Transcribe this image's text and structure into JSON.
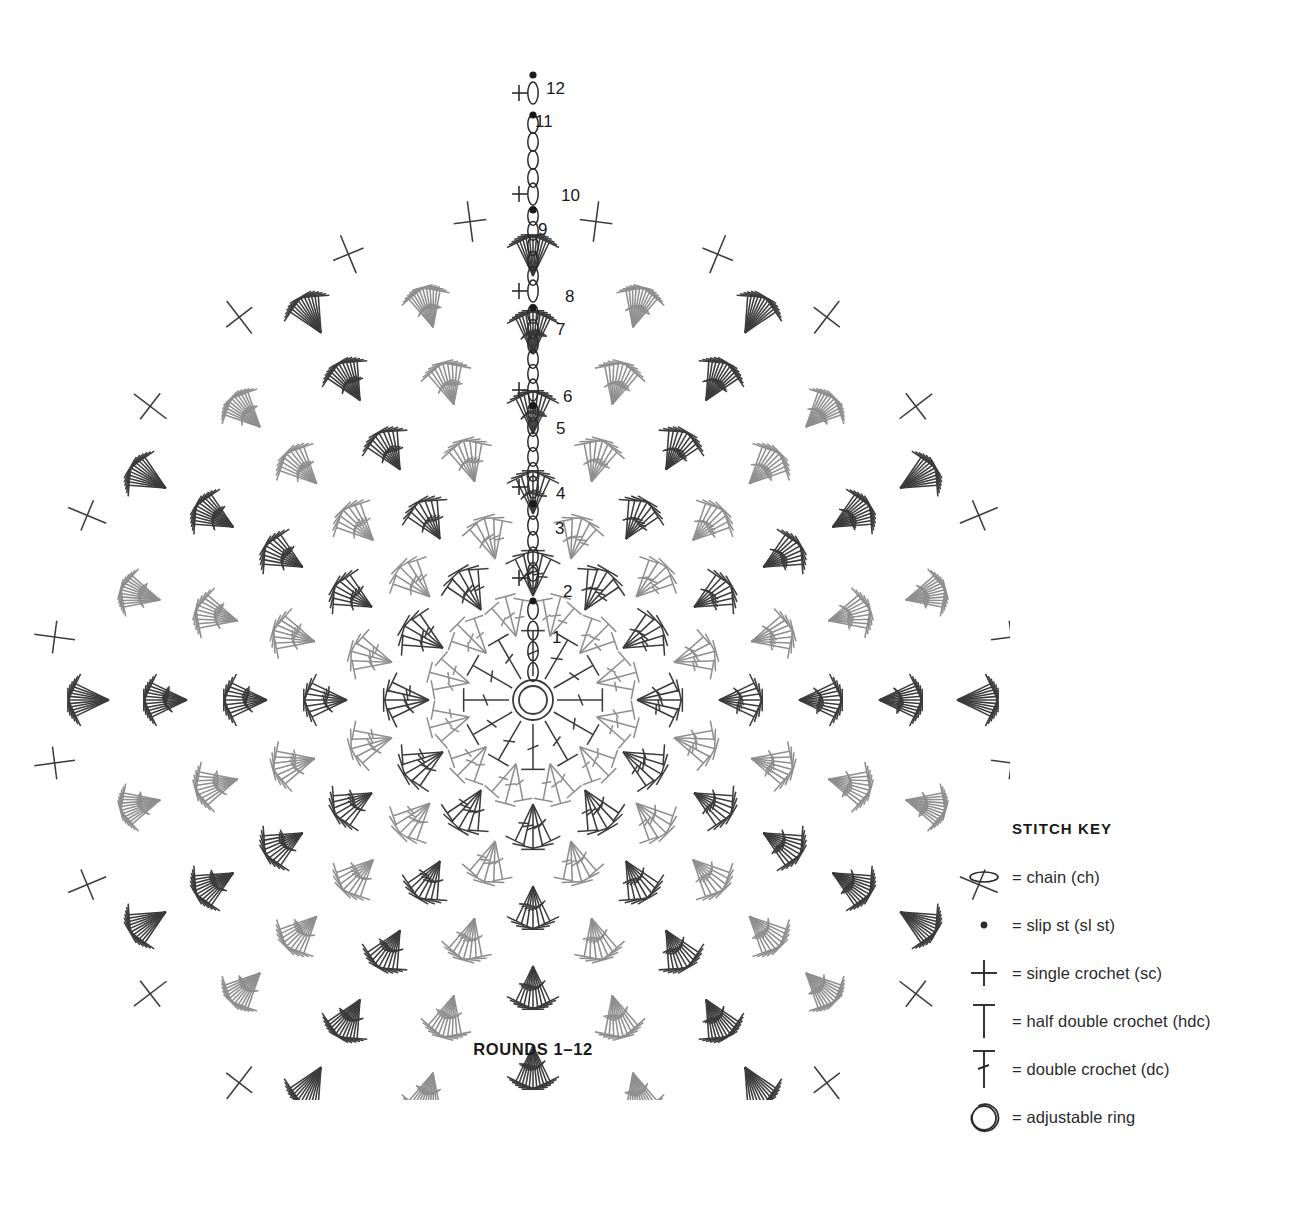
{
  "caption": "ROUNDS 1–12",
  "stitch_key": {
    "title": "STITCH KEY",
    "items": [
      {
        "icon": "chain-icon",
        "label": "= chain (ch)"
      },
      {
        "icon": "slip-stitch-icon",
        "label": "= slip st (sl st)"
      },
      {
        "icon": "single-crochet-icon",
        "label": "= single crochet (sc)"
      },
      {
        "icon": "half-double-crochet-icon",
        "label": "= half double crochet (hdc)"
      },
      {
        "icon": "double-crochet-icon",
        "label": "= double crochet (dc)"
      },
      {
        "icon": "adjustable-ring-icon",
        "label": "= adjustable ring"
      }
    ]
  },
  "colors": {
    "dark": "#3c3c3c",
    "light": "#8f8f8f",
    "text": "#1a1a1a",
    "background": "#ffffff"
  },
  "chart_data": {
    "type": "diagram",
    "title": "ROUNDS 1–12",
    "center": {
      "x": 533,
      "y": 700
    },
    "ring": {
      "label": "adjustable ring",
      "outer_radius": 20,
      "inner_radius": 14
    },
    "round_labels": [
      "1",
      "2",
      "3",
      "4",
      "5",
      "6",
      "7",
      "8",
      "9",
      "10",
      "11",
      "12"
    ],
    "round_label_positions": [
      {
        "round": "1",
        "x": 552,
        "y": 643
      },
      {
        "round": "2",
        "x": 563,
        "y": 597
      },
      {
        "round": "3",
        "x": 555,
        "y": 534
      },
      {
        "round": "4",
        "x": 556,
        "y": 499
      },
      {
        "round": "5",
        "x": 556,
        "y": 434
      },
      {
        "round": "6",
        "x": 563,
        "y": 402
      },
      {
        "round": "7",
        "x": 556,
        "y": 335
      },
      {
        "round": "8",
        "x": 565,
        "y": 302
      },
      {
        "round": "9",
        "x": 538,
        "y": 235
      },
      {
        "round": "10",
        "x": 561,
        "y": 201
      },
      {
        "round": "11",
        "x": 535,
        "y": 127
      },
      {
        "round": "12",
        "x": 546,
        "y": 94
      }
    ],
    "rounds": [
      {
        "round": 1,
        "radius": 66,
        "clusters": 12,
        "stitch": "dc",
        "tone": "dark",
        "per_cluster": 1
      },
      {
        "round": 2,
        "radius": 104,
        "clusters": 12,
        "stitch": "dc",
        "tone": "light",
        "per_cluster": 3
      },
      {
        "round": 3,
        "radius": 146,
        "clusters": 12,
        "stitch": "dc",
        "tone": "dark",
        "per_cluster": 5
      },
      {
        "round": 4,
        "radius": 186,
        "clusters": 12,
        "stitch": "dc",
        "tone": "light",
        "per_cluster": 5
      },
      {
        "round": 5,
        "radius": 226,
        "clusters": 12,
        "stitch": "dc",
        "tone": "dark",
        "per_cluster": 7
      },
      {
        "round": 6,
        "radius": 266,
        "clusters": 12,
        "stitch": "dc",
        "tone": "light",
        "per_cluster": 7
      },
      {
        "round": 7,
        "radius": 306,
        "clusters": 12,
        "stitch": "dc",
        "tone": "dark",
        "per_cluster": 9
      },
      {
        "round": 8,
        "radius": 346,
        "clusters": 12,
        "stitch": "dc",
        "tone": "light",
        "per_cluster": 9
      },
      {
        "round": 9,
        "radius": 386,
        "clusters": 12,
        "stitch": "dc",
        "tone": "dark",
        "per_cluster": 11
      },
      {
        "round": 10,
        "radius": 424,
        "clusters": 12,
        "stitch": "dc",
        "tone": "light",
        "per_cluster": 11
      },
      {
        "round": 11,
        "radius": 462,
        "clusters": 12,
        "stitch": "hdc",
        "tone": "dark",
        "per_cluster": 11
      },
      {
        "round": 12,
        "radius": 500,
        "clusters": 24,
        "stitch": "sc",
        "tone": "dark",
        "per_cluster": 1
      }
    ],
    "chain_column": {
      "description": "vertical column of chain ovals and slip-stitch dots running from the center ring to the top edge",
      "segments": [
        {
          "round": "1",
          "type": "chain",
          "count": 4,
          "y_top": 610,
          "y_bottom": 672
        },
        {
          "round": "2",
          "type": "slip-st",
          "count": 1,
          "y": 601
        },
        {
          "round": "2",
          "type": "chain-with-sc",
          "count": 1,
          "y": 578
        },
        {
          "round": "3",
          "type": "chain",
          "count": 5,
          "y_top": 510,
          "y_bottom": 572
        },
        {
          "round": "3",
          "type": "slip-st",
          "count": 1,
          "y": 504
        },
        {
          "round": "4",
          "type": "chain-with-sc",
          "count": 1,
          "y": 487
        },
        {
          "round": "5",
          "type": "chain",
          "count": 5,
          "y_top": 412,
          "y_bottom": 472
        },
        {
          "round": "5",
          "type": "slip-st",
          "count": 1,
          "y": 406
        },
        {
          "round": "6",
          "type": "chain-with-sc",
          "count": 1,
          "y": 390
        },
        {
          "round": "7",
          "type": "chain",
          "count": 5,
          "y_top": 314,
          "y_bottom": 374
        },
        {
          "round": "7",
          "type": "slip-st",
          "count": 1,
          "y": 308
        },
        {
          "round": "8",
          "type": "chain-with-sc",
          "count": 1,
          "y": 291
        },
        {
          "round": "9",
          "type": "chain",
          "count": 5,
          "y_top": 216,
          "y_bottom": 276
        },
        {
          "round": "9",
          "type": "slip-st",
          "count": 1,
          "y": 210
        },
        {
          "round": "10",
          "type": "chain-with-sc",
          "count": 1,
          "y": 194
        },
        {
          "round": "11",
          "type": "chain",
          "count": 4,
          "y_top": 124,
          "y_bottom": 178
        },
        {
          "round": "11",
          "type": "slip-st",
          "count": 1,
          "y": 115
        },
        {
          "round": "12",
          "type": "chain-with-sc",
          "count": 1,
          "y": 93
        },
        {
          "round": "12",
          "type": "slip-st",
          "count": 1,
          "y": 75
        }
      ]
    }
  }
}
